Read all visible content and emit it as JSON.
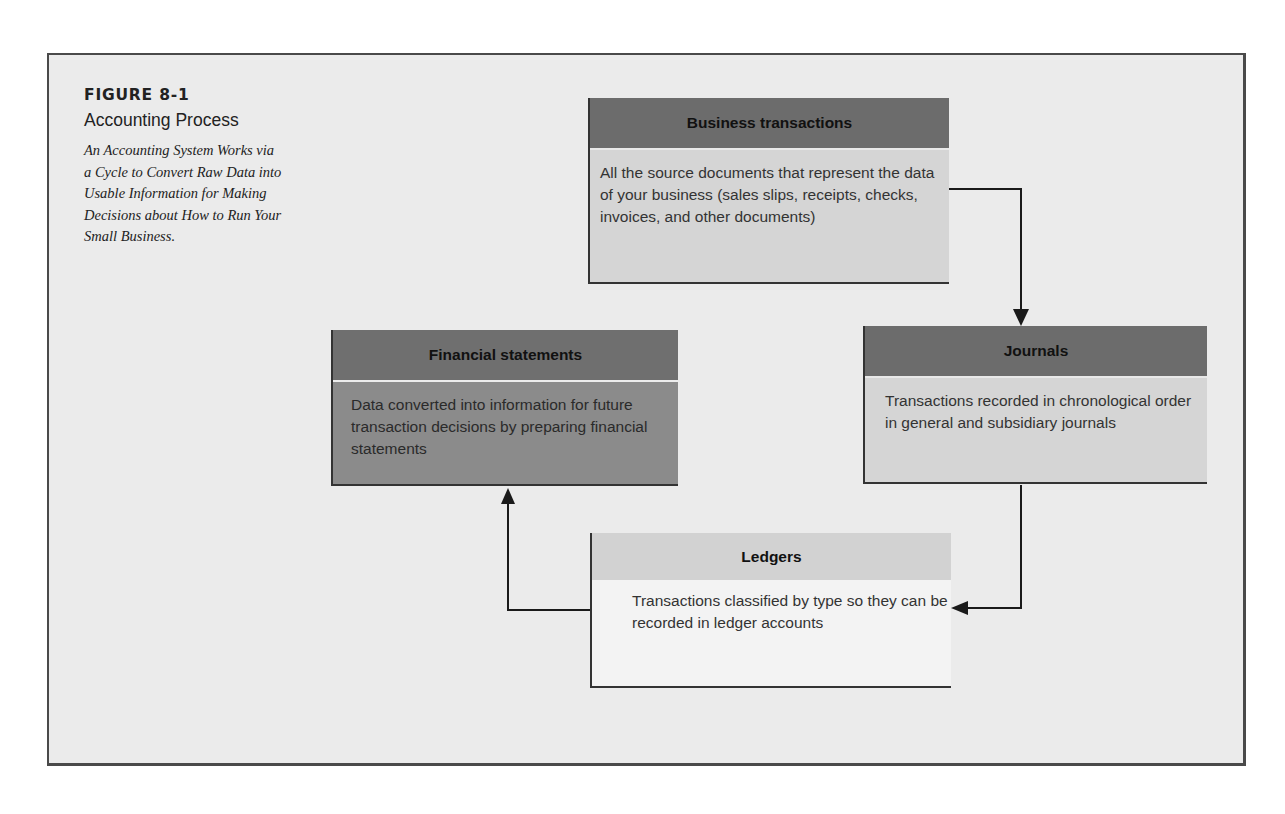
{
  "figure": {
    "label": "FIGURE 8-1",
    "title": "Accounting Process",
    "description": "An Accounting System Works via a Cycle to Convert Raw Data into Usable Information for Making Decisions about How to Run Your Small Business."
  },
  "nodes": [
    {
      "id": "business-transactions",
      "title": "Business transactions",
      "body": "All the source documents that represent the data of your business (sales slips, receipts, checks, invoices, and other documents)"
    },
    {
      "id": "journals",
      "title": "Journals",
      "body": "Transactions recorded in chronological order in general and subsidiary journals"
    },
    {
      "id": "ledgers",
      "title": "Ledgers",
      "body": "Transactions classified by type so they can be recorded in ledger accounts"
    },
    {
      "id": "financial-statements",
      "title": "Financial statements",
      "body": "Data converted into information for future transaction decisions by preparing financial statements"
    }
  ],
  "edges": [
    {
      "from": "business-transactions",
      "to": "journals"
    },
    {
      "from": "journals",
      "to": "ledgers"
    },
    {
      "from": "ledgers",
      "to": "financial-statements"
    }
  ],
  "colors": {
    "frame_bg": "#ebebeb",
    "header_dark": "#6c6c6c",
    "body_light": "#d5d5d5",
    "fs_body": "#8b8b8b",
    "ledger_header": "#d2d2d2",
    "ledger_body": "#f3f3f3",
    "line": "#1a1a1a"
  }
}
